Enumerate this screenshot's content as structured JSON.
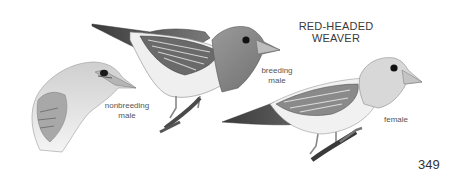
{
  "plate": {
    "title_lines": [
      "RED-HEADED",
      "WEAVER"
    ],
    "page_number": "349",
    "figures": [
      {
        "id": "nonbreeding-male",
        "caption_lines": [
          "nonbreeding",
          "male"
        ]
      },
      {
        "id": "breeding-male",
        "caption_lines": [
          "breeding",
          "male"
        ]
      },
      {
        "id": "female",
        "caption_lines": [
          "female"
        ]
      }
    ]
  },
  "colors": {
    "background": "#ffffff",
    "text": "#3a3a3a",
    "ink_dark": "#2a2a2a",
    "ink_mid": "#8a8a8a",
    "ink_light": "#d4d4d4"
  }
}
